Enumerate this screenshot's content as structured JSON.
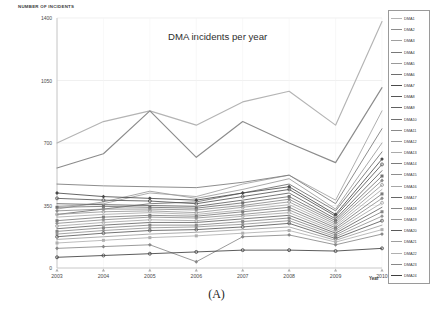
{
  "figure": {
    "caption": "(A)"
  },
  "chart_data": {
    "type": "line",
    "title": "DMA incidents per year",
    "xlabel": "Year",
    "ylabel": "NUMBER OF INCIDENTS",
    "categories": [
      "2003",
      "2004",
      "2005",
      "2006",
      "2007",
      "2008",
      "2009",
      "2010"
    ],
    "x": [
      2003,
      2004,
      2005,
      2006,
      2007,
      2008,
      2009,
      2010
    ],
    "ylim": [
      0,
      1400
    ],
    "yticks": [
      0,
      350,
      700,
      1050,
      1400
    ],
    "ytick_labels": [
      "0",
      "350",
      "700",
      "1050",
      "1400"
    ],
    "grid": true,
    "legend_position": "right",
    "series": [
      {
        "name": "DMA1",
        "color": "#b4b4b4",
        "values": [
          700,
          820,
          880,
          800,
          930,
          990,
          800,
          1380
        ]
      },
      {
        "name": "DMA2",
        "color": "#8c8c8c",
        "values": [
          560,
          640,
          880,
          620,
          820,
          700,
          590,
          1010
        ]
      },
      {
        "name": "DMA3",
        "color": "#a0a0a0",
        "values": [
          345,
          360,
          420,
          400,
          470,
          520,
          380,
          880
        ]
      },
      {
        "name": "DMA4",
        "color": "#787878",
        "values": [
          470,
          460,
          455,
          450,
          480,
          520,
          360,
          780
        ]
      },
      {
        "name": "DMA5",
        "color": "#9a9a9a",
        "values": [
          330,
          370,
          430,
          390,
          440,
          500,
          330,
          700
        ]
      },
      {
        "name": "DMA6",
        "color": "#6e6e6e",
        "values": [
          300,
          330,
          360,
          370,
          420,
          470,
          320,
          650
        ]
      },
      {
        "name": "DMA7",
        "color": "#4a4a4a",
        "values": [
          420,
          400,
          390,
          380,
          420,
          455,
          300,
          610
        ]
      },
      {
        "name": "DMA8",
        "color": "#555555",
        "values": [
          390,
          380,
          375,
          360,
          400,
          440,
          290,
          580
        ]
      },
      {
        "name": "DMA9",
        "color": "#606060",
        "values": [
          360,
          355,
          350,
          345,
          380,
          420,
          275,
          545
        ]
      },
      {
        "name": "DMA10",
        "color": "#707070",
        "values": [
          340,
          345,
          340,
          335,
          365,
          400,
          265,
          515
        ]
      },
      {
        "name": "DMA11",
        "color": "#8a8a8a",
        "values": [
          320,
          330,
          330,
          325,
          350,
          385,
          255,
          490
        ]
      },
      {
        "name": "DMA12",
        "color": "#989898",
        "values": [
          300,
          315,
          320,
          310,
          340,
          370,
          245,
          465
        ]
      },
      {
        "name": "DMA13",
        "color": "#aaaaaa",
        "values": [
          285,
          300,
          310,
          300,
          325,
          355,
          235,
          440
        ]
      },
      {
        "name": "DMA14",
        "color": "#7c7c7c",
        "values": [
          265,
          285,
          295,
          290,
          315,
          340,
          225,
          415
        ]
      },
      {
        "name": "DMA15",
        "color": "#8e8e8e",
        "values": [
          250,
          270,
          285,
          280,
          300,
          325,
          215,
          390
        ]
      },
      {
        "name": "DMA16",
        "color": "#a6a6a6",
        "values": [
          235,
          255,
          270,
          265,
          290,
          310,
          205,
          365
        ]
      },
      {
        "name": "DMA17",
        "color": "#666666",
        "values": [
          220,
          240,
          255,
          255,
          275,
          295,
          195,
          340
        ]
      },
      {
        "name": "DMA18",
        "color": "#858585",
        "values": [
          205,
          225,
          240,
          240,
          260,
          280,
          185,
          315
        ]
      },
      {
        "name": "DMA19",
        "color": "#949494",
        "values": [
          190,
          210,
          225,
          230,
          245,
          265,
          175,
          290
        ]
      },
      {
        "name": "DMA20",
        "color": "#5a5a5a",
        "values": [
          175,
          195,
          210,
          215,
          230,
          250,
          165,
          265
        ]
      },
      {
        "name": "DMA21",
        "color": "#9e9e9e",
        "values": [
          160,
          175,
          190,
          200,
          215,
          230,
          155,
          240
        ]
      },
      {
        "name": "DMA22",
        "color": "#b0b0b0",
        "values": [
          140,
          155,
          170,
          180,
          195,
          210,
          145,
          215
        ]
      },
      {
        "name": "DMA23",
        "color": "#888888",
        "values": [
          110,
          120,
          130,
          35,
          175,
          185,
          130,
          190
        ]
      },
      {
        "name": "DMA24",
        "color": "#3f3f3f",
        "values": [
          60,
          70,
          80,
          90,
          100,
          100,
          95,
          110
        ]
      }
    ]
  }
}
